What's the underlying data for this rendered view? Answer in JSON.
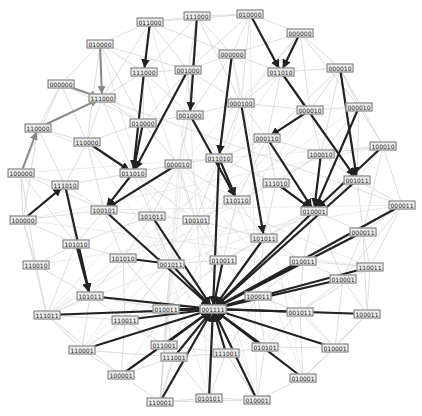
{
  "graph": {
    "type": "directed-network",
    "node_color": "#111111",
    "edge_colors": {
      "strong": "#222222",
      "medium": "#888888",
      "faint": "#cfcfcf"
    },
    "nodes": [
      {
        "id": "n1",
        "label": "011000",
        "x": 150,
        "y": 22
      },
      {
        "id": "n2",
        "label": "111000",
        "x": 197,
        "y": 16
      },
      {
        "id": "n3",
        "label": "010000",
        "x": 250,
        "y": 14
      },
      {
        "id": "n4",
        "label": "000000",
        "x": 300,
        "y": 33
      },
      {
        "id": "n5",
        "label": "010000",
        "x": 100,
        "y": 44
      },
      {
        "id": "n6",
        "label": "000000",
        "x": 232,
        "y": 54
      },
      {
        "id": "n7",
        "label": "111000",
        "x": 144,
        "y": 72
      },
      {
        "id": "n8",
        "label": "001000",
        "x": 188,
        "y": 70
      },
      {
        "id": "n9",
        "label": "011010",
        "x": 281,
        "y": 72
      },
      {
        "id": "n10",
        "label": "000010",
        "x": 340,
        "y": 68
      },
      {
        "id": "n11",
        "label": "000000",
        "x": 61,
        "y": 84
      },
      {
        "id": "n12",
        "label": "111000",
        "x": 102,
        "y": 98
      },
      {
        "id": "n13",
        "label": "000100",
        "x": 241,
        "y": 103
      },
      {
        "id": "n14",
        "label": "000010",
        "x": 310,
        "y": 110
      },
      {
        "id": "n15",
        "label": "010000",
        "x": 143,
        "y": 123
      },
      {
        "id": "n16",
        "label": "001000",
        "x": 190,
        "y": 115
      },
      {
        "id": "n17",
        "label": "110000",
        "x": 38,
        "y": 128
      },
      {
        "id": "n18",
        "label": "110000",
        "x": 87,
        "y": 142
      },
      {
        "id": "n19",
        "label": "000010",
        "x": 359,
        "y": 107
      },
      {
        "id": "n20",
        "label": "000110",
        "x": 267,
        "y": 138
      },
      {
        "id": "n21",
        "label": "100000",
        "x": 21,
        "y": 173
      },
      {
        "id": "n22",
        "label": "011010",
        "x": 133,
        "y": 173
      },
      {
        "id": "n23",
        "label": "000010",
        "x": 178,
        "y": 164
      },
      {
        "id": "n24",
        "label": "011010",
        "x": 219,
        "y": 158
      },
      {
        "id": "n25",
        "label": "100010",
        "x": 321,
        "y": 154
      },
      {
        "id": "n26",
        "label": "100010",
        "x": 383,
        "y": 146
      },
      {
        "id": "n27",
        "label": "111010",
        "x": 65,
        "y": 185
      },
      {
        "id": "n28",
        "label": "111010",
        "x": 276,
        "y": 183
      },
      {
        "id": "n29",
        "label": "001011",
        "x": 357,
        "y": 180
      },
      {
        "id": "n30",
        "label": "110110",
        "x": 237,
        "y": 200
      },
      {
        "id": "n31",
        "label": "100101",
        "x": 104,
        "y": 210
      },
      {
        "id": "n32",
        "label": "101011",
        "x": 152,
        "y": 216
      },
      {
        "id": "n33",
        "label": "100101",
        "x": 196,
        "y": 220
      },
      {
        "id": "n34",
        "label": "010001",
        "x": 314,
        "y": 211
      },
      {
        "id": "n35",
        "label": "000011",
        "x": 402,
        "y": 205
      },
      {
        "id": "n36",
        "label": "100000",
        "x": 23,
        "y": 220
      },
      {
        "id": "n37",
        "label": "101011",
        "x": 264,
        "y": 238
      },
      {
        "id": "n38",
        "label": "000011",
        "x": 363,
        "y": 232
      },
      {
        "id": "n39",
        "label": "101010",
        "x": 76,
        "y": 244
      },
      {
        "id": "n40",
        "label": "101010",
        "x": 123,
        "y": 258
      },
      {
        "id": "n41",
        "label": "001011",
        "x": 171,
        "y": 264
      },
      {
        "id": "n42",
        "label": "010011",
        "x": 223,
        "y": 260
      },
      {
        "id": "n43",
        "label": "010011",
        "x": 303,
        "y": 261
      },
      {
        "id": "n44",
        "label": "110010",
        "x": 36,
        "y": 265
      },
      {
        "id": "n45",
        "label": "110011",
        "x": 370,
        "y": 267
      },
      {
        "id": "n46",
        "label": "010001",
        "x": 343,
        "y": 279
      },
      {
        "id": "n47",
        "label": "100011",
        "x": 258,
        "y": 296
      },
      {
        "id": "n48",
        "label": "101011",
        "x": 90,
        "y": 296
      },
      {
        "id": "n49",
        "label": "010011",
        "x": 166,
        "y": 309
      },
      {
        "id": "n50",
        "label": "001111",
        "x": 213,
        "y": 309
      },
      {
        "id": "n51",
        "label": "001011",
        "x": 300,
        "y": 312
      },
      {
        "id": "n52",
        "label": "111011",
        "x": 47,
        "y": 315
      },
      {
        "id": "n53",
        "label": "110011",
        "x": 125,
        "y": 320
      },
      {
        "id": "n54",
        "label": "100011",
        "x": 367,
        "y": 314
      },
      {
        "id": "n55",
        "label": "011001",
        "x": 164,
        "y": 345
      },
      {
        "id": "n56",
        "label": "110001",
        "x": 82,
        "y": 350
      },
      {
        "id": "n57",
        "label": "111001",
        "x": 226,
        "y": 353
      },
      {
        "id": "n58",
        "label": "010101",
        "x": 265,
        "y": 347
      },
      {
        "id": "n59",
        "label": "010001",
        "x": 335,
        "y": 348
      },
      {
        "id": "n60",
        "label": "111001",
        "x": 174,
        "y": 357
      },
      {
        "id": "n61",
        "label": "100001",
        "x": 121,
        "y": 375
      },
      {
        "id": "n62",
        "label": "010001",
        "x": 303,
        "y": 378
      },
      {
        "id": "n63",
        "label": "010101",
        "x": 209,
        "y": 398
      },
      {
        "id": "n64",
        "label": "010001",
        "x": 257,
        "y": 400
      },
      {
        "id": "n65",
        "label": "110001",
        "x": 160,
        "y": 402
      }
    ],
    "edges": [
      {
        "from": "n1",
        "to": "n7",
        "w": "strong"
      },
      {
        "from": "n2",
        "to": "n16",
        "w": "strong"
      },
      {
        "from": "n3",
        "to": "n9",
        "w": "strong"
      },
      {
        "from": "n4",
        "to": "n9",
        "w": "strong"
      },
      {
        "from": "n5",
        "to": "n12",
        "w": "medium"
      },
      {
        "from": "n11",
        "to": "n12",
        "w": "medium"
      },
      {
        "from": "n17",
        "to": "n12",
        "w": "medium"
      },
      {
        "from": "n21",
        "to": "n17",
        "w": "medium"
      },
      {
        "from": "n7",
        "to": "n22",
        "w": "strong"
      },
      {
        "from": "n8",
        "to": "n22",
        "w": "strong"
      },
      {
        "from": "n18",
        "to": "n22",
        "w": "strong"
      },
      {
        "from": "n15",
        "to": "n22",
        "w": "strong"
      },
      {
        "from": "n9",
        "to": "n29",
        "w": "strong"
      },
      {
        "from": "n10",
        "to": "n29",
        "w": "strong"
      },
      {
        "from": "n13",
        "to": "n37",
        "w": "strong"
      },
      {
        "from": "n6",
        "to": "n24",
        "w": "strong"
      },
      {
        "from": "n14",
        "to": "n20",
        "w": "strong"
      },
      {
        "from": "n20",
        "to": "n34",
        "w": "strong"
      },
      {
        "from": "n19",
        "to": "n34",
        "w": "strong"
      },
      {
        "from": "n26",
        "to": "n34",
        "w": "strong"
      },
      {
        "from": "n25",
        "to": "n34",
        "w": "strong"
      },
      {
        "from": "n28",
        "to": "n34",
        "w": "strong"
      },
      {
        "from": "n16",
        "to": "n30",
        "w": "strong"
      },
      {
        "from": "n23",
        "to": "n31",
        "w": "strong"
      },
      {
        "from": "n27",
        "to": "n48",
        "w": "strong"
      },
      {
        "from": "n31",
        "to": "n50",
        "w": "strong"
      },
      {
        "from": "n32",
        "to": "n50",
        "w": "strong"
      },
      {
        "from": "n24",
        "to": "n30",
        "w": "strong"
      },
      {
        "from": "n22",
        "to": "n31",
        "w": "strong"
      },
      {
        "from": "n36",
        "to": "n27",
        "w": "strong"
      },
      {
        "from": "n40",
        "to": "n41",
        "w": "strong"
      },
      {
        "from": "n24",
        "to": "n50",
        "w": "strong"
      },
      {
        "from": "n35",
        "to": "n50",
        "w": "strong"
      },
      {
        "from": "n29",
        "to": "n50",
        "w": "strong"
      },
      {
        "from": "n34",
        "to": "n50",
        "w": "strong"
      },
      {
        "from": "n38",
        "to": "n50",
        "w": "strong"
      },
      {
        "from": "n42",
        "to": "n50",
        "w": "strong"
      },
      {
        "from": "n37",
        "to": "n50",
        "w": "strong"
      },
      {
        "from": "n43",
        "to": "n50",
        "w": "strong"
      },
      {
        "from": "n45",
        "to": "n50",
        "w": "strong"
      },
      {
        "from": "n46",
        "to": "n50",
        "w": "strong"
      },
      {
        "from": "n48",
        "to": "n50",
        "w": "strong"
      },
      {
        "from": "n52",
        "to": "n50",
        "w": "strong"
      },
      {
        "from": "n53",
        "to": "n50",
        "w": "strong"
      },
      {
        "from": "n49",
        "to": "n50",
        "w": "strong"
      },
      {
        "from": "n41",
        "to": "n50",
        "w": "strong"
      },
      {
        "from": "n47",
        "to": "n50",
        "w": "strong"
      },
      {
        "from": "n51",
        "to": "n50",
        "w": "strong"
      },
      {
        "from": "n54",
        "to": "n50",
        "w": "strong"
      },
      {
        "from": "n55",
        "to": "n50",
        "w": "strong"
      },
      {
        "from": "n56",
        "to": "n50",
        "w": "strong"
      },
      {
        "from": "n57",
        "to": "n50",
        "w": "strong"
      },
      {
        "from": "n58",
        "to": "n50",
        "w": "strong"
      },
      {
        "from": "n59",
        "to": "n50",
        "w": "strong"
      },
      {
        "from": "n60",
        "to": "n50",
        "w": "strong"
      },
      {
        "from": "n61",
        "to": "n50",
        "w": "strong"
      },
      {
        "from": "n62",
        "to": "n50",
        "w": "strong"
      },
      {
        "from": "n63",
        "to": "n50",
        "w": "strong"
      },
      {
        "from": "n64",
        "to": "n50",
        "w": "strong"
      },
      {
        "from": "n65",
        "to": "n50",
        "w": "strong"
      },
      {
        "from": "n39",
        "to": "n48",
        "w": "strong"
      }
    ]
  }
}
